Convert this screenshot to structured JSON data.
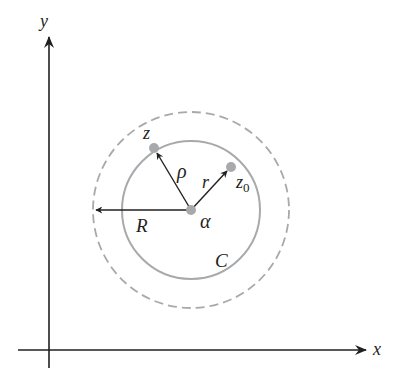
{
  "diagram": {
    "axes": {
      "x_label": "x",
      "y_label": "y"
    },
    "points": {
      "center_label": "α",
      "z_label": "z",
      "z0_label": "z",
      "z0_subscript": "0"
    },
    "radii": {
      "rho_label": "ρ",
      "r_label": "r",
      "R_label": "R"
    },
    "contour": {
      "label": "C"
    },
    "colors": {
      "axis": "#231f20",
      "circle": "#a7a9ac",
      "point": "#a7a9ac",
      "arrow": "#231f20"
    }
  }
}
